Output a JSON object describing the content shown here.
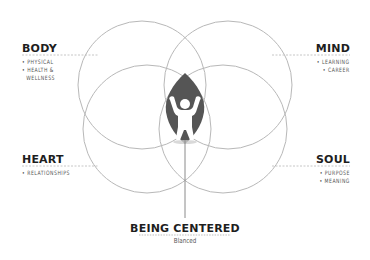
{
  "diagram": {
    "colors": {
      "circle_stroke": "#b5b5b5",
      "dash_stroke": "#b0b0b0",
      "leaf_fill": "#555555",
      "figure_fill": "#ffffff",
      "title_text": "#1e1e1e",
      "item_text": "#555555"
    },
    "quadrants": {
      "body": {
        "title": "BODY",
        "items": [
          "• PHYSICAL",
          "• HEALTH &",
          "WELLNESS"
        ]
      },
      "mind": {
        "title": "MIND",
        "items": [
          "• LEARNING",
          "• CAREER"
        ]
      },
      "heart": {
        "title": "HEART",
        "items": [
          "• RELATIONSHIPS"
        ]
      },
      "soul": {
        "title": "SOUL",
        "items": [
          "• PURPOSE",
          "• MEANING"
        ]
      }
    },
    "center": {
      "icon": "person-arms-raised-icon",
      "title": "BEING CENTERED",
      "subtitle": "Blanced"
    }
  }
}
